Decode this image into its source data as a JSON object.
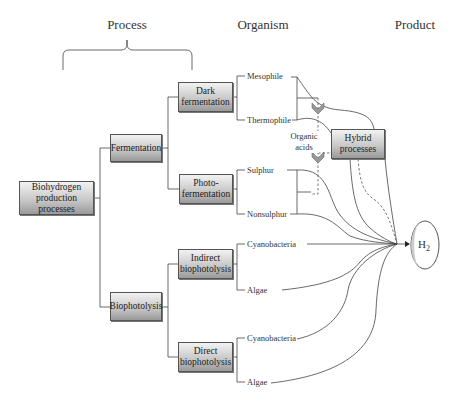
{
  "headers": {
    "process": "Process",
    "organism": "Organism",
    "product": "Product"
  },
  "boxes": {
    "root": "Biohydrogen production processes",
    "fermentation": "Fermentation",
    "dark_fermentation": "Dark fermentation",
    "photo_fermentation": "Photo-fermentation",
    "biophotolysis": "Biophotolysis",
    "indirect_biophotolysis": "Indirect biophotolysis",
    "direct_biophotolysis": "Direct biophotolysis",
    "hybrid": "Hybrid processes"
  },
  "organisms": {
    "dark": [
      "Mesophile",
      "Thermophile"
    ],
    "photo": [
      "Sulphur",
      "Nonsulphur"
    ],
    "indirect": [
      "Cyanobacteria",
      "Algae"
    ],
    "direct": [
      "Cyanobacteria",
      "Algae"
    ]
  },
  "annotations": {
    "organic_acids": "Organic acids"
  },
  "product": {
    "label": "H",
    "subscript": "2"
  },
  "colors": {
    "line": "#444444",
    "box_top": "#f2f2f2",
    "box_bottom": "#9a9a9a",
    "chevron": "#888888"
  }
}
